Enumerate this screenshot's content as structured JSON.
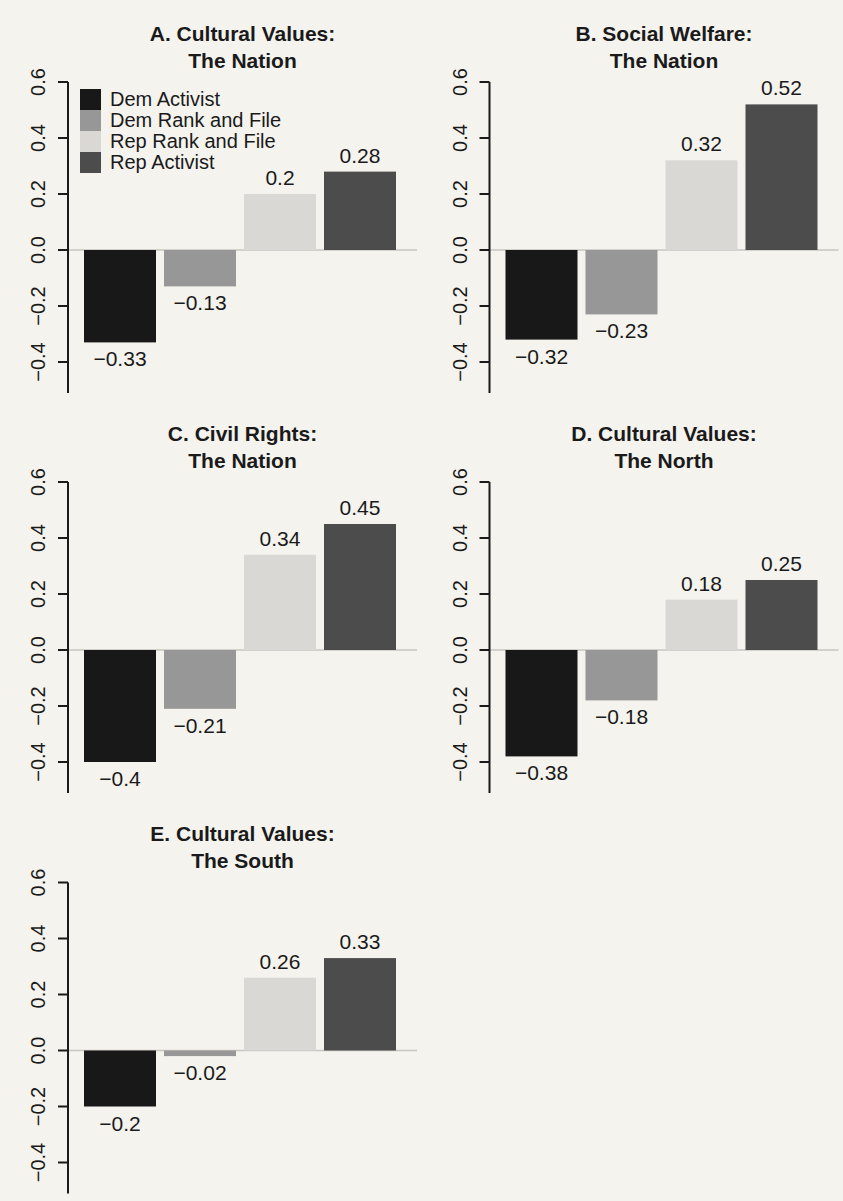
{
  "page": {
    "background": "#f4f3ee",
    "text_color": "#1a1a1a",
    "zero_line_color": "#c8c6c0",
    "axis_color": "#1a1a1a"
  },
  "series": [
    {
      "label": "Dem Activist",
      "color": "#181818"
    },
    {
      "label": "Dem Rank and File",
      "color": "#979797"
    },
    {
      "label": "Rep Rank and File",
      "color": "#d9d8d5"
    },
    {
      "label": "Rep Activist",
      "color": "#4c4c4c"
    }
  ],
  "axis": {
    "ylim": [
      -0.4,
      0.6
    ],
    "grid": false,
    "ticks": [
      {
        "value": 0.6,
        "label": "0.6"
      },
      {
        "value": 0.4,
        "label": "0.4"
      },
      {
        "value": 0.2,
        "label": "0.2"
      },
      {
        "value": 0.0,
        "label": "0.0"
      },
      {
        "value": -0.2,
        "label": "−0.2"
      },
      {
        "value": -0.4,
        "label": "−0.4"
      }
    ]
  },
  "chart_data": [
    {
      "type": "bar",
      "panel": "A",
      "title_lines": [
        "A. Cultural Values:",
        "The Nation"
      ],
      "categories": [
        "Dem Activist",
        "Dem Rank and File",
        "Rep Rank and File",
        "Rep Activist"
      ],
      "values": [
        -0.33,
        -0.13,
        0.2,
        0.28
      ],
      "value_labels": [
        "−0.33",
        "−0.13",
        "0.2",
        "0.28"
      ],
      "ylim": [
        -0.4,
        0.6
      ],
      "legend_visible": true
    },
    {
      "type": "bar",
      "panel": "B",
      "title_lines": [
        "B. Social Welfare:",
        "The Nation"
      ],
      "categories": [
        "Dem Activist",
        "Dem Rank and File",
        "Rep Rank and File",
        "Rep Activist"
      ],
      "values": [
        -0.32,
        -0.23,
        0.32,
        0.52
      ],
      "value_labels": [
        "−0.32",
        "−0.23",
        "0.32",
        "0.52"
      ],
      "ylim": [
        -0.4,
        0.6
      ],
      "legend_visible": false
    },
    {
      "type": "bar",
      "panel": "C",
      "title_lines": [
        "C. Civil Rights:",
        "The Nation"
      ],
      "categories": [
        "Dem Activist",
        "Dem Rank and File",
        "Rep Rank and File",
        "Rep Activist"
      ],
      "values": [
        -0.4,
        -0.21,
        0.34,
        0.45
      ],
      "value_labels": [
        "−0.4",
        "−0.21",
        "0.34",
        "0.45"
      ],
      "ylim": [
        -0.4,
        0.6
      ],
      "legend_visible": false
    },
    {
      "type": "bar",
      "panel": "D",
      "title_lines": [
        "D. Cultural Values:",
        "The North"
      ],
      "categories": [
        "Dem Activist",
        "Dem Rank and File",
        "Rep Rank and File",
        "Rep Activist"
      ],
      "values": [
        -0.38,
        -0.18,
        0.18,
        0.25
      ],
      "value_labels": [
        "−0.38",
        "−0.18",
        "0.18",
        "0.25"
      ],
      "ylim": [
        -0.4,
        0.6
      ],
      "legend_visible": false
    },
    {
      "type": "bar",
      "panel": "E",
      "title_lines": [
        "E. Cultural Values:",
        "The South"
      ],
      "categories": [
        "Dem Activist",
        "Dem Rank and File",
        "Rep Rank and File",
        "Rep Activist"
      ],
      "values": [
        -0.2,
        -0.02,
        0.26,
        0.33
      ],
      "value_labels": [
        "−0.2",
        "−0.02",
        "0.26",
        "0.33"
      ],
      "ylim": [
        -0.4,
        0.6
      ],
      "legend_visible": false
    }
  ]
}
